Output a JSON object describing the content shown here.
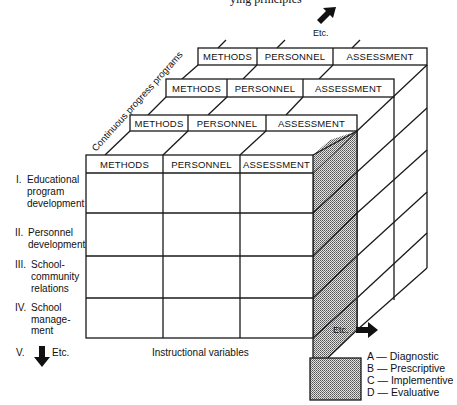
{
  "figure": {
    "top_cut_text": "ying principles",
    "depth_axis_label": "Continuous progress programs",
    "horizontal_axis_label": "Instructional variables",
    "depth_etc": "Etc.",
    "right_etc": "Etc.",
    "down_etc_numeral": "V.",
    "down_etc": "Etc."
  },
  "layers": [
    {
      "columns": [
        "METHODS",
        "PERSONNEL",
        "ASSESSMENT"
      ]
    },
    {
      "columns": [
        "METHODS",
        "PERSONNEL",
        "ASSESSMENT"
      ]
    },
    {
      "columns": [
        "METHODS",
        "PERSONNEL",
        "ASSESSMENT"
      ]
    },
    {
      "columns": [
        "METHODS",
        "PERSONNEL",
        "ASSESSMENT"
      ]
    }
  ],
  "rows": [
    {
      "numeral": "I.",
      "lines": [
        "Educational",
        "program",
        "development"
      ]
    },
    {
      "numeral": "II.",
      "lines": [
        "Personnel",
        "development"
      ]
    },
    {
      "numeral": "III.",
      "lines": [
        "School-",
        "community",
        "relations"
      ]
    },
    {
      "numeral": "IV.",
      "lines": [
        "School",
        "manage-",
        "ment"
      ]
    }
  ],
  "legend": {
    "swatch_color": "#b8b8b8",
    "items": [
      "A — Diagnostic",
      "B — Prescriptive",
      "C — Implementive",
      "D — Evaluative"
    ]
  },
  "colors": {
    "line": "#1a1a1a",
    "shade": "#b8b8b8",
    "background": "#ffffff"
  }
}
